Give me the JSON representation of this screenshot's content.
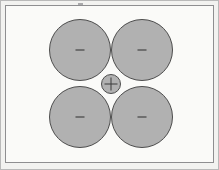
{
  "drawing": {
    "title": "Four-circle packing with central circle",
    "background_color": "#fafaf8",
    "page_background_color": "#f2f2f0",
    "frame": {
      "outer_border_color": "#b9b9b9",
      "inner_border_color": "#8e8e90",
      "inner_x": 5,
      "inner_y": 5,
      "inner_width": 209,
      "inner_height": 158
    },
    "shape_fill_color": "#b1b1b1",
    "shape_stroke_color": "#4d4d4d",
    "marker_color": "#6f6f6f",
    "circles": [
      {
        "name": "circle-top-left",
        "cx": 79,
        "cy": 49,
        "r": 31,
        "marker": "dash"
      },
      {
        "name": "circle-top-right",
        "cx": 141,
        "cy": 49,
        "r": 31,
        "marker": "dash"
      },
      {
        "name": "circle-bottom-left",
        "cx": 79,
        "cy": 116,
        "r": 31,
        "marker": "dash"
      },
      {
        "name": "circle-bottom-right",
        "cx": 141,
        "cy": 116,
        "r": 31,
        "marker": "dash"
      },
      {
        "name": "circle-center",
        "cx": 110,
        "cy": 83,
        "r": 10,
        "marker": "crosshair"
      }
    ],
    "top_tick": {
      "name": "top-edge-tick",
      "x": 78,
      "y": 3,
      "color": "#a9a9ab"
    }
  }
}
